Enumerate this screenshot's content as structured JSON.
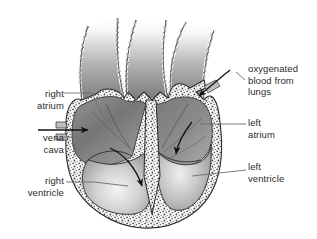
{
  "figure": {
    "type": "anatomical-diagram",
    "background_color": "#ffffff",
    "line_color": "#2b2b2b",
    "text_color": "#2b2b2b"
  },
  "labels": {
    "right_atrium": "right\natrium",
    "vena_cava": "vena\ncava",
    "right_ventricle": "right\nventricle",
    "oxygenated_blood": "oxygenated\nblood from\nlungs",
    "left_atrium": "left\natrium",
    "left_ventricle": "left\nventricle"
  },
  "structures": [
    {
      "name": "right-atrium",
      "side": "left-of-image",
      "shading": "dark-gray-gradient"
    },
    {
      "name": "left-atrium",
      "side": "right-of-image",
      "shading": "dark-gray-gradient"
    },
    {
      "name": "right-ventricle",
      "side": "left-of-image",
      "shading": "light-gray-gradient"
    },
    {
      "name": "left-ventricle",
      "side": "right-of-image",
      "shading": "light-gray-gradient"
    },
    {
      "name": "great-vessels",
      "position": "top",
      "count": 3,
      "shading": "fading-gray-to-white"
    },
    {
      "name": "myocardium-wall",
      "position": "outer-and-septum",
      "texture": "stippled"
    }
  ],
  "flow_arrows": [
    {
      "name": "vena-cava-inflow",
      "direction": "rightward-into-right-atrium"
    },
    {
      "name": "oxygenated-inflow",
      "direction": "down-left-into-left-atrium"
    },
    {
      "name": "right-atrium-to-right-ventricle",
      "direction": "curving-downward"
    },
    {
      "name": "left-atrium-to-left-ventricle",
      "direction": "curving-downward"
    }
  ],
  "colors": {
    "chamber_dark": "#6f6f6f",
    "chamber_mid": "#9a9a9a",
    "chamber_light": "#eaeaea",
    "wall_stipple": "#f2f2f2",
    "outline": "#2b2b2b",
    "leader_line": "#6e6e6e"
  }
}
